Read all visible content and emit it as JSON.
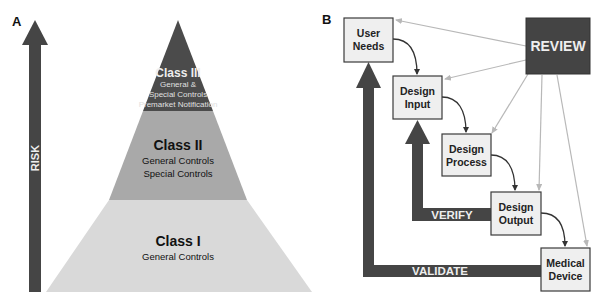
{
  "panels": {
    "a": {
      "label": "A",
      "risk_arrow": {
        "label": "RISK",
        "icon": "up-arrow-icon"
      },
      "pyramid": {
        "levels": [
          {
            "title": "Class III",
            "lines": [
              "General &",
              "Special Controls",
              "Premarket Notification"
            ],
            "color": "#4b4b4b",
            "text_color": "#eeeeee"
          },
          {
            "title": "Class II",
            "lines": [
              "General Controls",
              "Special Controls"
            ],
            "color": "#a9a9a9",
            "text_color": "#111111"
          },
          {
            "title": "Class I",
            "lines": [
              "General Controls"
            ],
            "color": "#d9d9d9",
            "text_color": "#111111"
          }
        ]
      }
    },
    "b": {
      "label": "B",
      "review": {
        "label": "REVIEW",
        "color": "#444444"
      },
      "boxes": [
        {
          "id": "user-needs",
          "lines": [
            "User",
            "Needs"
          ]
        },
        {
          "id": "design-input",
          "lines": [
            "Design",
            "Input"
          ]
        },
        {
          "id": "design-process",
          "lines": [
            "Design",
            "Process"
          ]
        },
        {
          "id": "design-output",
          "lines": [
            "Design",
            "Output"
          ]
        },
        {
          "id": "medical-device",
          "lines": [
            "Medical",
            "Device"
          ]
        }
      ],
      "verify_arrow": {
        "label": "VERIFY"
      },
      "validate_arrow": {
        "label": "VALIDATE"
      }
    }
  },
  "colors": {
    "dark": "#454545",
    "box_fill": "#efefef",
    "box_stroke": "#3a3a3a",
    "review_line": "#b8b8b8"
  }
}
